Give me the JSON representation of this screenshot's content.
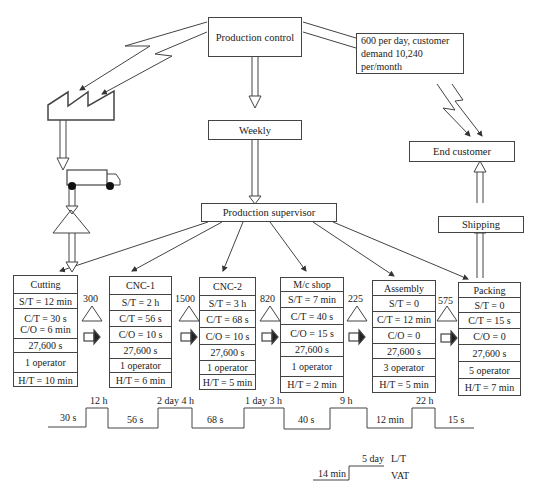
{
  "top": {
    "production_control": "Production control",
    "demand_note": "600 per day, customer demand 10,240 per/month",
    "weekly": "Weekly",
    "end_customer": "End customer",
    "shipping": "Shipping",
    "production_supervisor": "Production supervisor"
  },
  "processes": [
    {
      "name": "Cutting",
      "st": "S/T = 12 min",
      "ct": "C/T = 30 s",
      "co": "C/O = 6 min",
      "avail": "27,600 s",
      "ops": "1 operator",
      "ht": "H/T = 10 min"
    },
    {
      "name": "CNC-1",
      "st": "S/T = 2 h",
      "ct": "C/T = 56 s",
      "co": "C/O = 10 s",
      "avail": "27,600 s",
      "ops": "1 operator",
      "ht": "H/T = 6 min"
    },
    {
      "name": "CNC-2",
      "st": "S/T = 3 h",
      "ct": "C/T = 68 s",
      "co": "C/O = 10 s",
      "avail": "27,600 s",
      "ops": "1 operator",
      "ht": "H/T = 5 min"
    },
    {
      "name": "M/c shop",
      "st": "S/T = 7 min",
      "ct": "C/T = 40 s",
      "co": "C/O = 15 s",
      "avail": "27,600 s",
      "ops": "1 operator",
      "ht": "H/T = 2 min"
    },
    {
      "name": "Assembly",
      "st": "S/T = 0",
      "ct": "C/T = 12 min",
      "co": "C/O = 0",
      "avail": "27,600 s",
      "ops": "3 operator",
      "ht": "H/T = 5 min"
    },
    {
      "name": "Packing",
      "st": "S/T = 0",
      "ct": "C/T = 15 s",
      "co": "C/O = 0",
      "avail": "27,600 s",
      "ops": "5 operator",
      "ht": "H/T = 7 min"
    }
  ],
  "inventory": [
    "300",
    "1500",
    "820",
    "225",
    "575"
  ],
  "timeline": {
    "wait": [
      "12 h",
      "2 day 4 h",
      "1 day 3 h",
      "9 h",
      "22 h"
    ],
    "process": [
      "30 s",
      "56 s",
      "68 s",
      "40 s",
      "12 min",
      "15 s"
    ]
  },
  "summary": {
    "lead_time_value": "5 day",
    "lead_time_label": "L/T",
    "vat_value": "14 min",
    "vat_label": "VAT"
  }
}
